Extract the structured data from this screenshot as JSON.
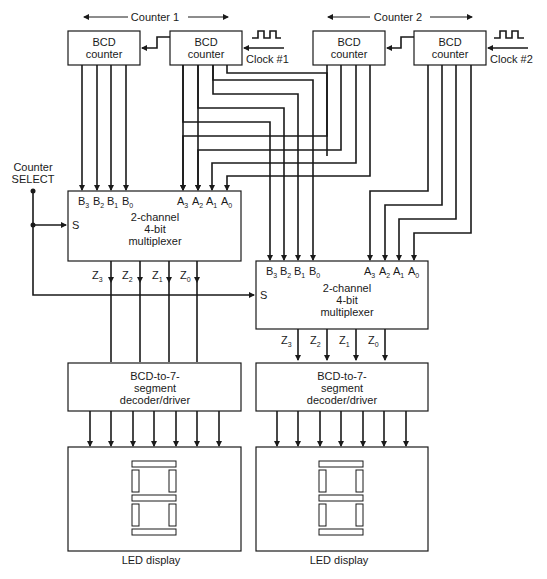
{
  "counters": [
    {
      "label": "Counter 1",
      "clock_label": "Clock #1"
    },
    {
      "label": "Counter 2",
      "clock_label": "Clock #2"
    }
  ],
  "bcd_counter": {
    "line1": "BCD",
    "line2": "counter"
  },
  "select": {
    "line1": "Counter",
    "line2": "SELECT"
  },
  "mux": {
    "line1": "2-channel",
    "line2": "4-bit",
    "line3": "multiplexer",
    "select_pin": "S",
    "b_inputs": [
      "B",
      "B",
      "B",
      "B"
    ],
    "b_subs": [
      "3",
      "2",
      "1",
      "0"
    ],
    "a_inputs": [
      "A",
      "A",
      "A",
      "A"
    ],
    "a_subs": [
      "3",
      "2",
      "1",
      "0"
    ],
    "outputs": [
      "Z",
      "Z",
      "Z",
      "Z"
    ],
    "out_subs": [
      "3",
      "2",
      "1",
      "0"
    ]
  },
  "decoder": {
    "line1": "BCD-to-7-",
    "line2": "segment",
    "line3": "decoder/driver"
  },
  "display": {
    "label": "LED display"
  },
  "colors": {
    "line": "#1a1a1a",
    "background": "#ffffff"
  }
}
